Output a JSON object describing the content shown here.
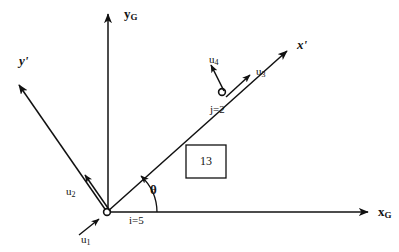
{
  "figure": {
    "type": "engineering-diagram",
    "background_color": "#ffffff",
    "line_color": "#111111",
    "width": 399,
    "height": 252
  },
  "axes": {
    "global_x": {
      "label": "x",
      "subscript": "G",
      "name": "x_G",
      "from": [
        107,
        212
      ],
      "to": [
        372,
        212
      ]
    },
    "global_y": {
      "label": "y",
      "subscript": "G",
      "name": "y_G",
      "from": [
        108,
        212
      ],
      "to": [
        108,
        10
      ]
    },
    "local_x": {
      "label": "x'",
      "name": "x-prime",
      "from": [
        107,
        212
      ],
      "to": [
        290,
        48
      ]
    },
    "local_y": {
      "label": "y'",
      "name": "y-prime",
      "from": [
        107,
        212
      ],
      "to": [
        16,
        82
      ]
    }
  },
  "angle": {
    "label": "θ",
    "name": "theta",
    "degrees": 46,
    "measured_from": "x_G",
    "measured_to": "x-prime"
  },
  "nodes": [
    {
      "id": "i",
      "label": "i=5",
      "number": 5,
      "position": [
        107,
        212
      ]
    },
    {
      "id": "j",
      "label": "j=2",
      "number": 2,
      "position": [
        222,
        92
      ]
    }
  ],
  "element": {
    "label": "13",
    "number": 13,
    "box": [
      186,
      145,
      40,
      33
    ]
  },
  "dof_arrows": [
    {
      "label": "u",
      "subscript": "1",
      "name": "u1",
      "at_node": "i",
      "direction": "along-x-prime",
      "label_pos": [
        81,
        234
      ]
    },
    {
      "label": "u",
      "subscript": "2",
      "name": "u2",
      "at_node": "i",
      "direction": "along-y-prime",
      "label_pos": [
        66,
        186
      ]
    },
    {
      "label": "u",
      "subscript": "3",
      "name": "u3",
      "at_node": "j",
      "direction": "along-x-prime",
      "label_pos": [
        256,
        66
      ]
    },
    {
      "label": "u",
      "subscript": "4",
      "name": "u4",
      "at_node": "j",
      "direction": "along-y-prime",
      "label_pos": [
        209,
        54
      ]
    }
  ]
}
